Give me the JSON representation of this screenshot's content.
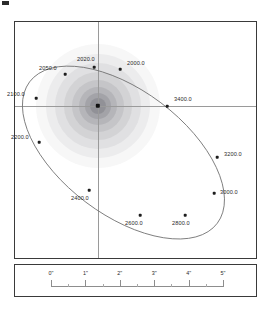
{
  "figure": {
    "type": "astrometric-orbit-plot",
    "background_color": "#ffffff",
    "frame_color": "#3a3a3a"
  },
  "chart_data": {
    "type": "scatter",
    "title": "",
    "xlabel": "",
    "ylabel": "",
    "grid": false,
    "legend": null,
    "axis_style": "crosshair",
    "x_unit": "arcsec",
    "y_unit": "arcsec",
    "orbit": {
      "shape": "ellipse",
      "center_x_px": 108,
      "center_y_px": 130,
      "semi_major_px": 117,
      "semi_minor_px": 62,
      "rotation_deg": 37,
      "stroke_color": "#6e6e6e"
    },
    "primary_star": {
      "label": "primary",
      "x_px": 83,
      "y_px": 84,
      "marker": "square",
      "color": "#111111"
    },
    "epochs": [
      {
        "label": "2000.0",
        "x_px": 105,
        "y_px": 47,
        "label_x_px": 112,
        "label_y_px": 38
      },
      {
        "label": "2020.0",
        "x_px": 79,
        "y_px": 45,
        "label_x_px": 62,
        "label_y_px": 34
      },
      {
        "label": "2050.0",
        "x_px": 50,
        "y_px": 52,
        "label_x_px": 24,
        "label_y_px": 43
      },
      {
        "label": "2100.0",
        "x_px": 21,
        "y_px": 76,
        "label_x_px": -8,
        "label_y_px": 69
      },
      {
        "label": "2200.0",
        "x_px": 24,
        "y_px": 120,
        "label_x_px": -4,
        "label_y_px": 112
      },
      {
        "label": "2400.0",
        "x_px": 74,
        "y_px": 168,
        "label_x_px": 56,
        "label_y_px": 173
      },
      {
        "label": "2600.0",
        "x_px": 125,
        "y_px": 193,
        "label_x_px": 110,
        "label_y_px": 198
      },
      {
        "label": "2800.0",
        "x_px": 170,
        "y_px": 193,
        "label_x_px": 157,
        "label_y_px": 198
      },
      {
        "label": "3000.0",
        "x_px": 199,
        "y_px": 171,
        "label_x_px": 205,
        "label_y_px": 167
      },
      {
        "label": "3200.0",
        "x_px": 202,
        "y_px": 135,
        "label_x_px": 209,
        "label_y_px": 129
      },
      {
        "label": "3400.0",
        "x_px": 152,
        "y_px": 84,
        "label_x_px": 159,
        "label_y_px": 74
      }
    ]
  },
  "scale_bar": {
    "unit_symbol": "\"",
    "ticks": [
      {
        "label": "0\"",
        "offset_px": 0
      },
      {
        "label": "1\"",
        "offset_px": 34.4
      },
      {
        "label": "2\"",
        "offset_px": 68.8
      },
      {
        "label": "3\"",
        "offset_px": 103.2
      },
      {
        "label": "4\"",
        "offset_px": 137.6
      },
      {
        "label": "5\"",
        "offset_px": 172
      }
    ],
    "minor_offsets_px": [
      17.2,
      51.6,
      86,
      120.4,
      154.8
    ]
  }
}
